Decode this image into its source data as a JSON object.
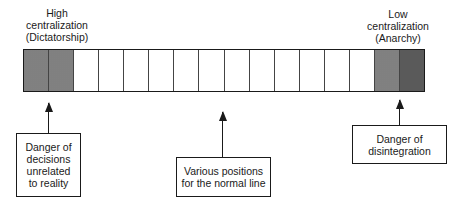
{
  "top_labels": {
    "left": {
      "lines": [
        "High",
        "centralization",
        "(Dictatorship)"
      ]
    },
    "right": {
      "lines": [
        "Low",
        "centralization",
        "(Anarchy)"
      ]
    }
  },
  "bar": {
    "cell_count": 16,
    "shaded_left_cells": 2,
    "shaded_right_cells": 2,
    "shade_color": "#d8d8d8",
    "dot_color": "#7a7a7a",
    "border_color": "#1a1a1a"
  },
  "callouts": {
    "left": {
      "lines": [
        "Danger of",
        "decisions",
        "unrelated",
        "to reality"
      ]
    },
    "middle": {
      "lines": [
        "Various positions",
        "for the normal line"
      ]
    },
    "right": {
      "lines": [
        "Danger of",
        "disintegration"
      ]
    }
  }
}
